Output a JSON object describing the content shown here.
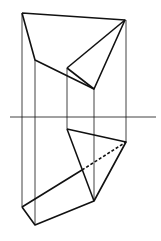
{
  "diagram": {
    "type": "orthographic-projection",
    "width": 161,
    "height": 241,
    "colors": {
      "line": "#111111",
      "background": "#ffffff"
    },
    "axis_line": {
      "x1": 10,
      "y1": 117,
      "x2": 156,
      "y2": 117
    },
    "top_view": {
      "vertices": {
        "a": [
          22,
          13
        ],
        "b": [
          125,
          20
        ],
        "c": [
          35,
          60
        ],
        "d": [
          67,
          68
        ],
        "e": [
          94,
          89
        ]
      }
    },
    "front_view": {
      "vertices": {
        "f": [
          67,
          129
        ],
        "g": [
          126,
          142
        ],
        "h": [
          94,
          201
        ],
        "i": [
          22,
          207
        ],
        "j": [
          35,
          225
        ]
      }
    },
    "projection_lines_x": [
      22,
      35,
      67,
      94,
      126
    ]
  }
}
